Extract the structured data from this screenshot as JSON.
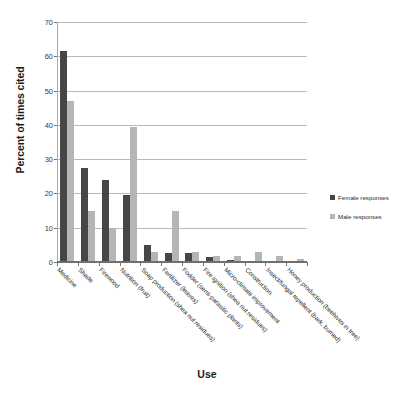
{
  "chart_data": {
    "type": "bar",
    "title": "",
    "xlabel": "Use",
    "ylabel": "Percent of times cited",
    "ylim": [
      0,
      70
    ],
    "yticks": [
      0,
      10,
      20,
      30,
      40,
      50,
      60,
      70
    ],
    "grid": true,
    "legend_position": "right",
    "categories": [
      "Medicine",
      "Shade",
      "Firewood",
      "Nutrition (fruit)",
      "Soap production (shea nut residues)",
      "Fertilizer (leaves)",
      "Fodder (semi-parasitic plants)",
      "Fire ignition (shea nut residues)",
      "Micro-climate improvement",
      "Construction",
      "Insect/fungal repellent (bark, burned)",
      "Honey production (beehives in tree)"
    ],
    "series": [
      {
        "name": "Female responses",
        "color": "#464646",
        "values": [
          61.5,
          27.5,
          24.0,
          19.5,
          5.0,
          2.7,
          2.7,
          1.6,
          0.7,
          0.0,
          0.0,
          0.0
        ]
      },
      {
        "name": "Male responses",
        "color": "#b5b5b5",
        "values": [
          47.0,
          14.8,
          9.8,
          39.4,
          3.0,
          14.8,
          3.0,
          1.8,
          1.7,
          3.0,
          1.7,
          0.8
        ]
      }
    ]
  },
  "legend": {
    "items": [
      {
        "label": "Female responses",
        "color": "#464646"
      },
      {
        "label": "Male responses",
        "color": "#b5b5b5"
      }
    ]
  }
}
